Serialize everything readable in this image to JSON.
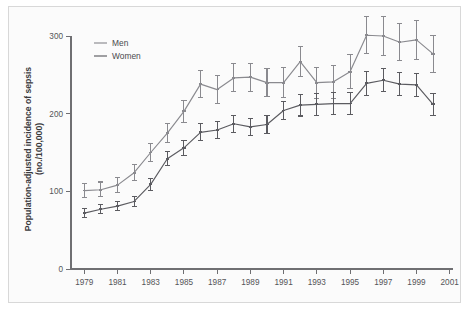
{
  "figure": {
    "background_color": "#fbfbfb",
    "border_color": "#d8d8d8",
    "axis_color": "#6f6f72"
  },
  "axes": {
    "ylabel_line1": "Population-adjusted incidence of sepsis",
    "ylabel_line2": "(no./100,000)",
    "y_ticks": [
      "0",
      "100",
      "200",
      "300"
    ],
    "x_ticks": [
      "1979",
      "1981",
      "1983",
      "1985",
      "1987",
      "1989",
      "1991",
      "1993",
      "1995",
      "1997",
      "1999",
      "2001"
    ]
  },
  "legend": {
    "position": "top-left-inside",
    "entries": [
      {
        "label": "Men",
        "color": "#8a8a8f"
      },
      {
        "label": "Women",
        "color": "#5b5b60"
      }
    ]
  },
  "chart_data": {
    "type": "line",
    "title": "",
    "xlabel": "",
    "ylabel": "Population-adjusted incidence of sepsis (no./100,000)",
    "xlim": [
      1978.2,
      2001.2
    ],
    "ylim": [
      0,
      310
    ],
    "grid": false,
    "errorbars": true,
    "x": [
      1979,
      1980,
      1981,
      1982,
      1983,
      1984,
      1985,
      1986,
      1987,
      1988,
      1989,
      1990,
      1991,
      1992,
      1993,
      1994,
      1995,
      1996,
      1997,
      1998,
      1999,
      2000
    ],
    "series": [
      {
        "name": "Men",
        "color": "#8a8a8f",
        "values": [
          101,
          102,
          108,
          124,
          150,
          175,
          203,
          238,
          231,
          246,
          247,
          240,
          240,
          267,
          240,
          241,
          254,
          301,
          300,
          292,
          295,
          277
        ],
        "err_low": [
          92,
          93,
          99,
          114,
          139,
          163,
          189,
          221,
          213,
          228,
          229,
          222,
          221,
          248,
          220,
          220,
          232,
          277,
          275,
          268,
          270,
          253
        ],
        "err_high": [
          110,
          112,
          118,
          134,
          161,
          187,
          217,
          256,
          249,
          264,
          265,
          258,
          259,
          286,
          260,
          262,
          276,
          325,
          325,
          316,
          320,
          301
        ]
      },
      {
        "name": "Women",
        "color": "#5b5b60",
        "values": [
          72,
          77,
          81,
          87,
          109,
          142,
          156,
          176,
          179,
          187,
          183,
          186,
          204,
          211,
          212,
          213,
          213,
          239,
          243,
          238,
          237,
          212
        ],
        "err_low": [
          66,
          71,
          75,
          81,
          101,
          133,
          146,
          165,
          168,
          176,
          172,
          174,
          192,
          197,
          198,
          199,
          199,
          224,
          228,
          223,
          222,
          198
        ],
        "err_high": [
          78,
          83,
          87,
          93,
          117,
          151,
          166,
          187,
          190,
          198,
          194,
          198,
          216,
          225,
          226,
          227,
          227,
          254,
          258,
          253,
          252,
          226
        ]
      }
    ]
  }
}
